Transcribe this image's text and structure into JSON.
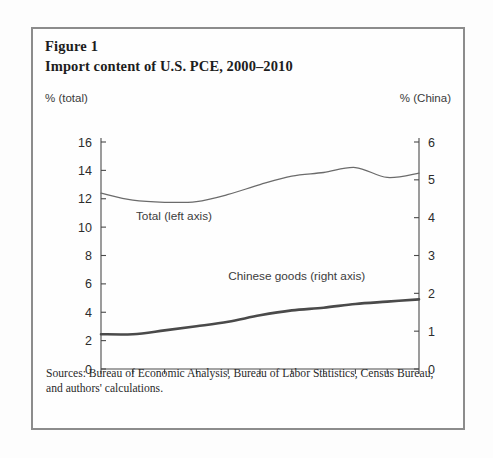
{
  "figure": {
    "label": "Figure 1",
    "title": "Import content of U.S. PCE, 2000–2010",
    "left_axis_unit": "% (total)",
    "right_axis_unit": "% (China)",
    "source": "Sources: Bureau of Economic Analysis, Bureau of Labor Statistics, Census Bureau, and authors' calculations."
  },
  "chart_data": {
    "type": "line",
    "title": "Import content of U.S. PCE, 2000–2010",
    "xlabel": "",
    "ylabel": "% (total)",
    "y2label": "% (China)",
    "x": [
      2000,
      2001,
      2002,
      2003,
      2004,
      2005,
      2006,
      2007,
      2008,
      2009,
      2010
    ],
    "xtick_labels": [
      "2000",
      "2002",
      "2004",
      "2006",
      "2008",
      "2010"
    ],
    "xtick_values": [
      2000,
      2002,
      2004,
      2006,
      2008,
      2010
    ],
    "xlim": [
      2000,
      2010
    ],
    "ylim": [
      0,
      16
    ],
    "ytick_values": [
      0,
      2,
      4,
      6,
      8,
      10,
      12,
      14,
      16
    ],
    "ytick_labels": [
      "0",
      "2",
      "4",
      "6",
      "8",
      "10",
      "12",
      "14",
      "16"
    ],
    "y2lim": [
      0,
      6
    ],
    "y2tick_values": [
      0,
      1,
      2,
      3,
      4,
      5,
      6
    ],
    "y2tick_labels": [
      "0",
      "1",
      "2",
      "3",
      "4",
      "5",
      "6"
    ],
    "grid": false,
    "legend": "inline-annotations",
    "series": [
      {
        "name": "Total (left axis)",
        "axis": "left",
        "color": "#6b6b6b",
        "label_x": 2001.1,
        "label_y": 10.5,
        "values": [
          12.4,
          11.9,
          11.75,
          11.8,
          12.3,
          13.0,
          13.6,
          13.85,
          14.2,
          13.5,
          13.8
        ]
      },
      {
        "name": "Chinese goods (right axis)",
        "axis": "right",
        "color": "#4a4a4a",
        "label_x": 2004.0,
        "label_y": 2.35,
        "values": [
          0.92,
          0.92,
          1.02,
          1.13,
          1.25,
          1.42,
          1.55,
          1.62,
          1.72,
          1.78,
          1.84
        ]
      }
    ]
  }
}
